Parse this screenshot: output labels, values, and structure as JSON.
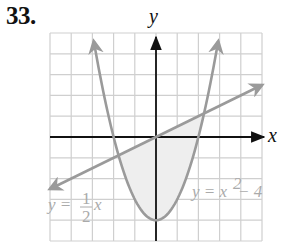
{
  "problem": {
    "number": "33."
  },
  "chart_data": {
    "type": "line",
    "title": "",
    "xlabel": "x",
    "ylabel": "y",
    "xlim": [
      -5,
      5
    ],
    "ylim": [
      -5,
      5
    ],
    "grid": true,
    "grid_step": 1,
    "tick_labels": false,
    "series": [
      {
        "name": "y = x^2 - 4",
        "function": "x^2 - 4",
        "label_parts": [
          "y = x",
          "2",
          " − 4"
        ],
        "color": "#9a9a9a",
        "arrows": "both-ends-up"
      },
      {
        "name": "y = 1/2 x",
        "function": "0.5*x",
        "label_parts": [
          "y = ",
          "1",
          "2",
          "x"
        ],
        "color": "#9a9a9a",
        "arrows": "both-ends"
      }
    ],
    "shaded_region": {
      "description": "Region bounded between y = 1/2 x (above) and y = x^2 - 4 (below)",
      "x_from": -1.766,
      "x_to": 2.266,
      "color": "#eeeeee"
    },
    "intersections": [
      {
        "x": -1.766,
        "y": -0.883
      },
      {
        "x": 2.266,
        "y": 1.133
      }
    ]
  },
  "colors": {
    "grid": "#cfcfcf",
    "axes": "#111111",
    "curves": "#9a9a9a",
    "labels": "#aaaaaa",
    "shade": "#eeeeee"
  }
}
